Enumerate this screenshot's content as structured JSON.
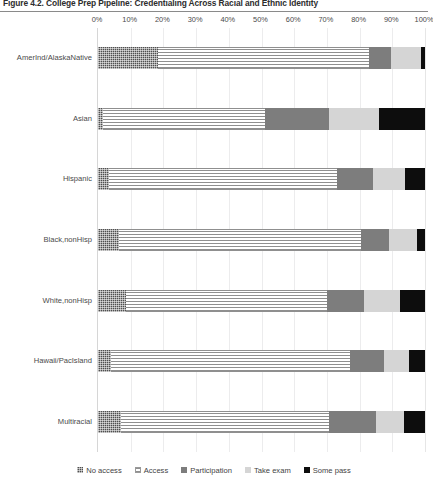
{
  "figure": {
    "title": "Figure 4.2. College Prep Pipeline: Credentialing Across Racial and Ethnic Identity"
  },
  "legend": {
    "position": "bottom",
    "items": [
      {
        "label": "No access",
        "key": "no_access",
        "color": "#4f4f4f",
        "pattern": "checker"
      },
      {
        "label": "Access",
        "key": "access",
        "color": "#8f8f8f",
        "pattern": "horizontal-lines"
      },
      {
        "label": "Participation",
        "key": "participation",
        "color": "#7d7d7d",
        "pattern": "solid"
      },
      {
        "label": "Take exam",
        "key": "take_exam",
        "color": "#d5d5d5",
        "pattern": "solid"
      },
      {
        "label": "Some pass",
        "key": "some_pass",
        "color": "#0d0d0d",
        "pattern": "solid"
      }
    ]
  },
  "chart_data": {
    "type": "bar",
    "orientation": "horizontal",
    "stacked": true,
    "stack_total": 100,
    "title": "Figure 4.2. College Prep Pipeline: Credentialing Across Racial and Ethnic Identity",
    "xlabel": "",
    "ylabel": "",
    "xlim": [
      0,
      100
    ],
    "xticks": [
      0,
      10,
      20,
      30,
      40,
      50,
      60,
      70,
      80,
      90,
      100
    ],
    "xtick_labels": [
      "0%",
      "10%",
      "20%",
      "30%",
      "40%",
      "50%",
      "60%",
      "70%",
      "80%",
      "90%",
      "100%"
    ],
    "grid": true,
    "legend_entries": [
      "No access",
      "Access",
      "Participation",
      "Take exam",
      "Some pass"
    ],
    "categories": [
      "AmerInd/AlaskaNative",
      "Asian",
      "Hispanic",
      "Black,nonHisp",
      "White,nonHisp",
      "Hawaii/PacIsland",
      "Multiracial"
    ],
    "series": [
      {
        "name": "No access",
        "values": [
          18.5,
          1.5,
          3.5,
          6.5,
          8.5,
          4.0,
          7.0
        ]
      },
      {
        "name": "Access",
        "values": [
          64.4,
          49.5,
          69.5,
          74.0,
          61.5,
          73.0,
          63.5
        ]
      },
      {
        "name": "Participation",
        "values": [
          6.7,
          19.5,
          11.0,
          8.5,
          11.5,
          10.5,
          14.5
        ]
      },
      {
        "name": "Take exam",
        "values": [
          9.2,
          15.5,
          10.0,
          8.5,
          11.0,
          7.5,
          8.5
        ]
      },
      {
        "name": "Some pass",
        "values": [
          1.2,
          14.0,
          6.0,
          2.5,
          7.5,
          5.0,
          6.5
        ]
      }
    ]
  }
}
